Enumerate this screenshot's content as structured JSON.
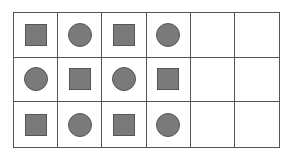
{
  "grid": {
    "rows": 3,
    "cols": 6,
    "cells": [
      [
        "square",
        "circle",
        "square",
        "circle",
        "",
        ""
      ],
      [
        "circle",
        "square",
        "circle",
        "square",
        "",
        ""
      ],
      [
        "square",
        "circle",
        "square",
        "circle",
        "",
        ""
      ]
    ]
  },
  "colors": {
    "shape_fill": "#7a7a7a",
    "shape_border": "#555555",
    "grid_line": "#555555"
  }
}
